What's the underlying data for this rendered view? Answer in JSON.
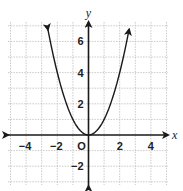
{
  "chart_data": {
    "type": "line",
    "title": "",
    "xlabel": "x",
    "ylabel": "y",
    "origin_label": "O",
    "xlim": [
      -5,
      5
    ],
    "ylim": [
      -3,
      7
    ],
    "x_ticks": [
      -4,
      -2,
      2,
      4
    ],
    "y_ticks": [
      6,
      4,
      2,
      -2
    ],
    "x_tick_labels": [
      "−4",
      "−2",
      "2",
      "4"
    ],
    "y_tick_labels": [
      "6",
      "4",
      "2",
      "−2"
    ],
    "grid": true,
    "grid_step": 1,
    "series": [
      {
        "name": "y = x^2",
        "equation": "y = x^2",
        "x": [
          -2.6,
          -2,
          -1.5,
          -1,
          -0.5,
          0,
          0.5,
          1,
          1.5,
          2,
          2.6
        ],
        "y": [
          6.76,
          4,
          2.25,
          1,
          0.25,
          0,
          0.25,
          1,
          2.25,
          4,
          6.76
        ]
      }
    ],
    "colors": {
      "axis": "#1a1a1a",
      "grid": "#bdbdbd",
      "curve": "#1a1a1a"
    }
  }
}
